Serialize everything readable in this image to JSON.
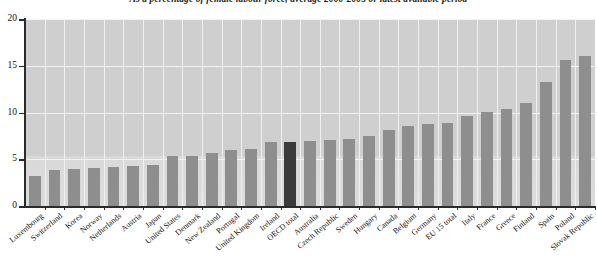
{
  "chart_data": {
    "type": "bar",
    "title": "As a percentage of female labour force, average 2000-2005 or latest available period",
    "xlabel": "",
    "ylabel": "",
    "ylim": [
      0,
      20
    ],
    "yticks": [
      0,
      5,
      10,
      15,
      20
    ],
    "grid": true,
    "legend": "none",
    "highlight_categories": [
      "OECD total"
    ],
    "categories": [
      "Luxembourg",
      "Switzerland",
      "Korea",
      "Norway",
      "Netherlands",
      "Austria",
      "Japan",
      "United States",
      "Denmark",
      "New Zealand",
      "Portugal",
      "United Kingdom",
      "Ireland",
      "OECD total",
      "Australia",
      "Czech Republic",
      "Sweden",
      "Hungary",
      "Canada",
      "Belgium",
      "Germany",
      "EU 15 total",
      "Italy",
      "France",
      "Greece",
      "Finland",
      "Spain",
      "Poland",
      "Slovak Republic"
    ],
    "values": [
      3.2,
      3.9,
      4.0,
      4.1,
      4.2,
      4.3,
      4.4,
      5.3,
      5.4,
      5.7,
      6.0,
      6.1,
      6.8,
      6.9,
      7.0,
      7.1,
      7.2,
      7.5,
      8.1,
      8.6,
      8.8,
      8.9,
      9.6,
      10.1,
      10.4,
      11.0,
      13.3,
      15.6,
      16.0
    ]
  },
  "colors": {
    "bar": "#8e8e8e",
    "bar_highlight": "#3b3b3b",
    "plot_background": "#cfcfcf",
    "plot_background_lower": "#dcdcdc",
    "gridline": "#f2f2f2",
    "axis": "#2b2b2b",
    "text": "#111111",
    "page_background": "#ffffff"
  }
}
